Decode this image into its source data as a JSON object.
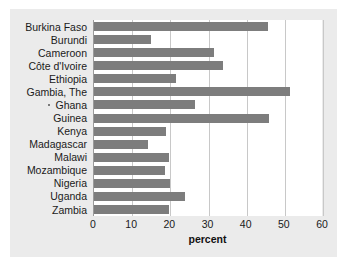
{
  "chart_data": {
    "type": "bar",
    "orientation": "horizontal",
    "title": "",
    "xlabel": "percent",
    "ylabel": "",
    "xlim": [
      0,
      60
    ],
    "xticks": [
      0,
      10,
      20,
      30,
      40,
      50,
      60
    ],
    "grid": true,
    "legend": null,
    "bar_color": "#7d7d7d",
    "categories": [
      "Burkina Faso",
      "Burundi",
      "Cameroon",
      "Côte d'Ivoire",
      "Ethiopia",
      "Gambia, The",
      "Ghana",
      "Guinea",
      "Kenya",
      "Madagascar",
      "Malawi",
      "Mozambique",
      "Nigeria",
      "Uganda",
      "Zambia"
    ],
    "values": [
      45.6,
      14.9,
      31.4,
      33.8,
      21.5,
      51.3,
      26.5,
      45.8,
      18.9,
      14.1,
      19.6,
      18.6,
      19.9,
      23.8,
      19.6
    ]
  },
  "colors": {
    "panel_background": "#ebebeb",
    "plot_background": "#ffffff",
    "bar": "#7d7d7d",
    "gridline": "#c8c8c8",
    "axis": "#9a9a9a",
    "text": "#1a1a1a"
  }
}
